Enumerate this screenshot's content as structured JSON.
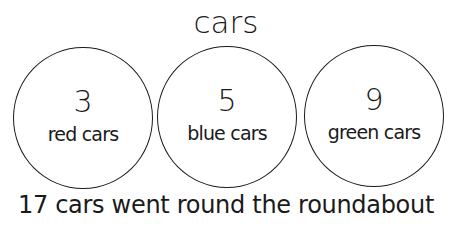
{
  "title": "cars",
  "groups": [
    {
      "count": "3",
      "label": "red cars"
    },
    {
      "count": "5",
      "label": "blue cars"
    },
    {
      "count": "9",
      "label": "green cars"
    }
  ],
  "caption": "17 cars went round the roundabout",
  "colors": {
    "stroke": "#1a1a1a",
    "background": "#ffffff"
  }
}
